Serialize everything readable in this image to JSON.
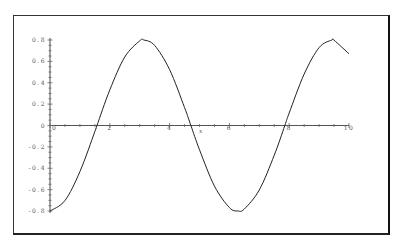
{
  "chart_data": {
    "type": "line",
    "title": "",
    "xlabel": "x",
    "ylabel": "",
    "xlim": [
      0,
      10
    ],
    "ylim": [
      -0.8,
      0.8
    ],
    "grid": false,
    "legend": "none",
    "x_ticks": [
      0,
      2,
      4,
      6,
      8,
      10
    ],
    "x_tick_labels": [
      "0",
      "2",
      "4",
      "6",
      "8",
      "10"
    ],
    "y_ticks": [
      0.8,
      0.6,
      0.4,
      0.2,
      0,
      -0.2,
      -0.4,
      -0.6,
      -0.8
    ],
    "y_tick_labels": [
      "0.8",
      "0.6",
      "0.4",
      "0.2",
      "0",
      "-0.2",
      "-0.4",
      "-0.6",
      "-0.8"
    ],
    "series": [
      {
        "name": "-0.8*cos(x)",
        "color": "#222222",
        "x": [
          0,
          0.5,
          1,
          1.5,
          1.571,
          2,
          2.5,
          3,
          3.142,
          3.5,
          4,
          4.5,
          4.712,
          5,
          5.5,
          6,
          6.283,
          6.5,
          7,
          7.5,
          7.854,
          8,
          8.5,
          9,
          9.425,
          9.5,
          10
        ],
        "y": [
          -0.8,
          -0.702,
          -0.432,
          -0.057,
          0,
          0.333,
          0.641,
          0.792,
          0.8,
          0.749,
          0.523,
          0.168,
          0,
          -0.227,
          -0.567,
          -0.768,
          -0.8,
          -0.781,
          -0.603,
          -0.278,
          0,
          0.117,
          0.481,
          0.729,
          0.8,
          0.798,
          0.671
        ]
      }
    ]
  }
}
